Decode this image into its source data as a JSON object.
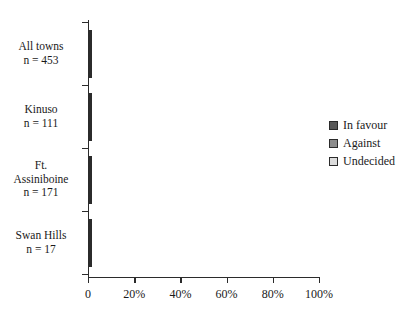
{
  "chart_data": {
    "type": "bar",
    "orientation": "horizontal",
    "stacked": true,
    "normalized": true,
    "title": "",
    "subtitle": "",
    "xlabel": "",
    "ylabel": "",
    "xlim": [
      0,
      100
    ],
    "xticks": [
      0,
      20,
      40,
      60,
      80,
      100
    ],
    "xticklabels": [
      "0",
      "20%",
      "40%",
      "60%",
      "80%",
      "100%"
    ],
    "grid": false,
    "legend_position": "right",
    "categories": [
      "All towns",
      "Kinuso",
      "Ft. Assiniboine",
      "Swan Hills"
    ],
    "category_labels": [
      {
        "name": "All towns",
        "n": "n = 453"
      },
      {
        "name": "Kinuso",
        "n": "n = 111"
      },
      {
        "name": "Ft.\nAssiniboine",
        "n": "n = 171"
      },
      {
        "name": "Swan Hills",
        "n": "n = 17"
      }
    ],
    "series": [
      {
        "name": "In favour",
        "color": "#595959",
        "values": [
          40,
          8,
          28,
          72.5
        ]
      },
      {
        "name": "Against",
        "color": "#8c8c8c",
        "values": [
          42,
          72,
          45.5,
          13.5
        ]
      },
      {
        "name": "Undecided",
        "color": "#dcdcdc",
        "values": [
          18,
          20,
          26.5,
          14
        ]
      }
    ]
  },
  "axes": {
    "x_tick_labels": [
      "0",
      "20%",
      "40%",
      "60%",
      "80%",
      "100%"
    ],
    "x_tick_values": [
      0,
      20,
      40,
      60,
      80,
      100
    ]
  },
  "categories": [
    {
      "name": "All towns",
      "n_label": "n = 453",
      "name_line2": ""
    },
    {
      "name": "Kinuso",
      "n_label": "n = 111",
      "name_line2": ""
    },
    {
      "name": "Ft.",
      "n_label": "n = 171",
      "name_line2": "Assiniboine"
    },
    {
      "name": "Swan Hills",
      "n_label": "n = 17",
      "name_line2": ""
    }
  ],
  "legend": {
    "items": [
      {
        "label": "In favour",
        "color": "#595959"
      },
      {
        "label": "Against",
        "color": "#8c8c8c"
      },
      {
        "label": "Undecided",
        "color": "#dcdcdc"
      }
    ]
  },
  "colors": {
    "in_favour": "#595959",
    "against": "#8c8c8c",
    "undecided": "#dcdcdc",
    "axis": "#2b2b2b",
    "background": "#ffffff",
    "text": "#1a1a1a"
  }
}
